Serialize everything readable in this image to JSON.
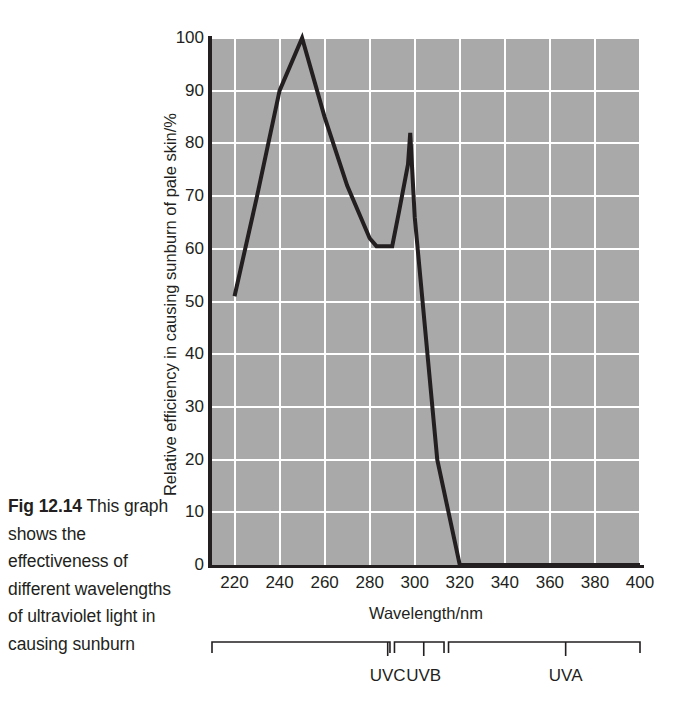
{
  "caption": {
    "figure_number": "Fig 12.14",
    "text": "This graph shows the effectiveness of different wavelengths of ultraviolet light in causing sunburn"
  },
  "chart_data": {
    "type": "line",
    "title": "",
    "xlabel": "Wavelength/nm",
    "ylabel": "Relative efficiency in causing sunburn of pale skin/%",
    "xlim": [
      210,
      400
    ],
    "ylim": [
      0,
      100
    ],
    "xticks": [
      220,
      240,
      260,
      280,
      300,
      320,
      340,
      360,
      380,
      400
    ],
    "yticks": [
      0,
      10,
      20,
      30,
      40,
      50,
      60,
      70,
      80,
      90,
      100
    ],
    "xtick_labels": [
      "220",
      "240",
      "260",
      "280",
      "300",
      "320",
      "340",
      "360",
      "380",
      "400"
    ],
    "ytick_labels": [
      "0",
      "10",
      "20",
      "30",
      "40",
      "50",
      "60",
      "70",
      "80",
      "90",
      "100"
    ],
    "grid": true,
    "grid_color": "#ffffff",
    "plot_background": "#a9a9a9",
    "line_color": "#231f20",
    "legend": null,
    "x": [
      220,
      230,
      240,
      250,
      260,
      270,
      280,
      283,
      290,
      293,
      297,
      298,
      300,
      310,
      320,
      400
    ],
    "y": [
      51,
      70,
      90,
      100,
      85,
      72,
      62,
      60.5,
      60.5,
      67,
      76,
      82,
      66,
      20,
      0,
      0
    ],
    "series": [
      {
        "name": "Erythemal action spectrum",
        "values": [
          51,
          70,
          90,
          100,
          85,
          72,
          62,
          60.5,
          60.5,
          67,
          76,
          82,
          66,
          20,
          0,
          0
        ]
      }
    ],
    "annotations": [
      {
        "label": "peak",
        "x": 250,
        "y": 100
      },
      {
        "label": "secondary peak",
        "x": 298,
        "y": 82
      },
      {
        "label": "trough",
        "x": 286,
        "y": 60.5
      }
    ]
  },
  "bands": [
    {
      "name": "UVC",
      "label": "UVC",
      "start_nm": 210,
      "end_nm": 289,
      "label_nm": 288
    },
    {
      "name": "UVB",
      "label": "UVB",
      "start_nm": 291,
      "end_nm": 313,
      "label_nm": 304
    },
    {
      "name": "UVA",
      "label": "UVA",
      "start_nm": 315,
      "end_nm": 400,
      "label_nm": 367
    }
  ]
}
